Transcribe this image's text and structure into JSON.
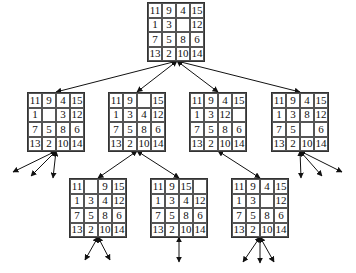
{
  "nodes": {
    "root": {
      "x": 147,
      "y": 2,
      "cells": [
        "11",
        "9",
        "4",
        "15",
        "1",
        "3",
        "",
        "12",
        "7",
        "5",
        "8",
        "6",
        "13",
        "2",
        "10",
        "14"
      ]
    },
    "c1": {
      "x": 27,
      "y": 92,
      "cells": [
        "11",
        "9",
        "4",
        "15",
        "1",
        "",
        "3",
        "12",
        "7",
        "5",
        "8",
        "6",
        "13",
        "2",
        "10",
        "14"
      ]
    },
    "c2": {
      "x": 108,
      "y": 92,
      "cells": [
        "11",
        "9",
        "",
        "15",
        "1",
        "3",
        "4",
        "12",
        "7",
        "5",
        "8",
        "6",
        "13",
        "2",
        "10",
        "14"
      ]
    },
    "c3": {
      "x": 189,
      "y": 92,
      "cells": [
        "11",
        "9",
        "4",
        "15",
        "1",
        "3",
        "12",
        "",
        "7",
        "5",
        "8",
        "6",
        "13",
        "2",
        "10",
        "14"
      ]
    },
    "c4": {
      "x": 271,
      "y": 92,
      "cells": [
        "11",
        "9",
        "4",
        "15",
        "1",
        "3",
        "8",
        "12",
        "7",
        "5",
        "",
        "6",
        "13",
        "2",
        "10",
        "14"
      ]
    },
    "g1": {
      "x": 69,
      "y": 178,
      "cells": [
        "11",
        "",
        "9",
        "15",
        "1",
        "3",
        "4",
        "12",
        "7",
        "5",
        "8",
        "6",
        "13",
        "2",
        "10",
        "14"
      ]
    },
    "g2": {
      "x": 150,
      "y": 178,
      "cells": [
        "11",
        "9",
        "15",
        "",
        "1",
        "3",
        "4",
        "12",
        "7",
        "5",
        "8",
        "6",
        "13",
        "2",
        "10",
        "14"
      ]
    },
    "g3": {
      "x": 231,
      "y": 178,
      "cells": [
        "11",
        "9",
        "4",
        "15",
        "1",
        "3",
        "",
        "12",
        "7",
        "5",
        "8",
        "6",
        "13",
        "2",
        "10",
        "14"
      ]
    }
  },
  "edges": [
    {
      "from": [
        177,
        61
      ],
      "to": [
        56,
        92
      ]
    },
    {
      "from": [
        177,
        61
      ],
      "to": [
        137,
        92
      ]
    },
    {
      "from": [
        177,
        61
      ],
      "to": [
        218,
        92
      ]
    },
    {
      "from": [
        177,
        61
      ],
      "to": [
        300,
        92
      ]
    },
    {
      "from": [
        137,
        151
      ],
      "to": [
        98,
        178
      ]
    },
    {
      "from": [
        137,
        151
      ],
      "to": [
        179,
        178
      ]
    },
    {
      "from": [
        218,
        151
      ],
      "to": [
        260,
        178
      ]
    },
    {
      "from": [
        56,
        151
      ],
      "to": [
        13,
        172
      ]
    },
    {
      "from": [
        56,
        151
      ],
      "to": [
        31,
        176
      ]
    },
    {
      "from": [
        56,
        151
      ],
      "to": [
        53,
        178
      ]
    },
    {
      "from": [
        300,
        151
      ],
      "to": [
        301,
        178
      ]
    },
    {
      "from": [
        300,
        151
      ],
      "to": [
        322,
        176
      ]
    },
    {
      "from": [
        300,
        151
      ],
      "to": [
        342,
        172
      ]
    },
    {
      "from": [
        98,
        237
      ],
      "to": [
        85,
        260
      ]
    },
    {
      "from": [
        98,
        237
      ],
      "to": [
        110,
        260
      ]
    },
    {
      "from": [
        179,
        237
      ],
      "to": [
        179,
        262
      ]
    },
    {
      "from": [
        260,
        237
      ],
      "to": [
        243,
        262
      ]
    },
    {
      "from": [
        260,
        237
      ],
      "to": [
        260,
        263
      ]
    },
    {
      "from": [
        260,
        237
      ],
      "to": [
        274,
        262
      ]
    }
  ]
}
